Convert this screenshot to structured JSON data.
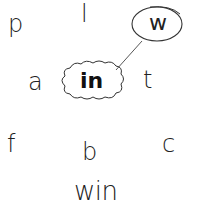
{
  "puzzle": {
    "center_word": "in",
    "circled_letter": "w",
    "answer_word": "win",
    "letters": [
      {
        "id": "p",
        "text": "p",
        "x": 8,
        "y": 12
      },
      {
        "id": "l",
        "text": "l",
        "x": 81,
        "y": 2
      },
      {
        "id": "a",
        "text": "a",
        "x": 28,
        "y": 70
      },
      {
        "id": "t",
        "text": "t",
        "x": 143,
        "y": 68
      },
      {
        "id": "f",
        "text": "f",
        "x": 7,
        "y": 132
      },
      {
        "id": "b",
        "text": "b",
        "x": 82,
        "y": 140
      },
      {
        "id": "c",
        "text": "c",
        "x": 162,
        "y": 132
      }
    ]
  },
  "colors": {
    "stroke": "#333333",
    "text": "#222222",
    "background": "#ffffff"
  }
}
